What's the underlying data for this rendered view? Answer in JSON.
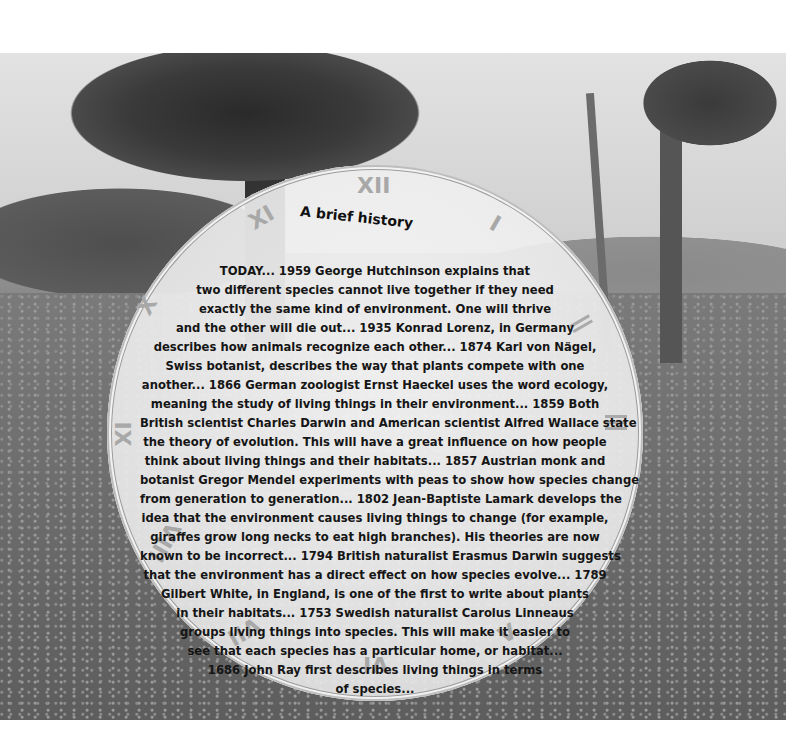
{
  "title": "A brief history",
  "clock_numerals": {
    "xii": "XII",
    "i": "I",
    "ii": "II",
    "iii": "III",
    "v": "V",
    "vi": "VI",
    "vii": "VII",
    "viii": "VIII",
    "ix": "IX",
    "x": "X",
    "xi": "XI"
  },
  "body_lines": [
    "TODAY... 1959 George Hutchinson explains that",
    "two different species cannot live together if they need",
    "exactly the same kind of environment. One will thrive",
    "and the other will die out... 1935 Konrad Lorenz, in Germany",
    "describes how animals recognize each other... 1874 Karl von Nägel,",
    "Swiss botanist, describes the way that plants compete with one",
    "another... 1866 German zoologist Ernst Haeckel uses the word ecology,",
    "meaning the study of living things in their environment... 1859 Both",
    "British scientist Charles Darwin and American scientist Alfred Wallace state",
    "the theory of evolution. This will have a great influence on how people",
    "think about living things and their habitats... 1857 Austrian monk and",
    "botanist Gregor Mendel experiments with peas to show how species change",
    "from generation to generation... 1802 Jean-Baptiste Lamark develops the",
    "idea that the environment causes living things to change (for example,",
    "giraffes grow long necks to eat high branches). His theories are now",
    "known to be incorrect... 1794 British naturalist Erasmus Darwin suggests",
    "that the environment has a direct effect on how species evolve... 1789",
    "Gilbert White, in England, is one of the first to write about plants",
    "in their habitats... 1753 Swedish naturalist Carolus Linneaus",
    "groups living things into species. This will make it easier to",
    "see that each species has a particular home, or habitat...",
    "1686 John Ray first describes living things in terms",
    "of species..."
  ],
  "colors": {
    "text": "#151515",
    "numeral": "#a8a8a8",
    "clock_face": "#ececec"
  }
}
